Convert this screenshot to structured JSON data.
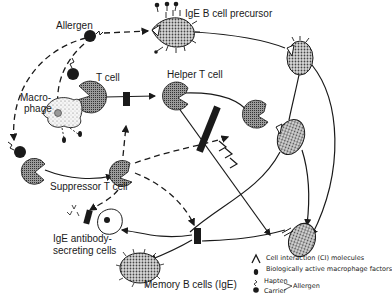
{
  "labels": {
    "allergen": "Allergen",
    "ige_b_precursor": "IgE B cell precursor",
    "t_cell": "T cell",
    "helper_t_cell": "Helper T cell",
    "macrophage_1": "Macro-",
    "macrophage_2": "phage",
    "suppressor_t_cell": "Suppressor T cell",
    "ige_secreting_1": "IgE antibody-",
    "ige_secreting_2": "secreting cells",
    "memory_b": "Memory B cells (IgE)"
  },
  "legend": {
    "ci": "Cell interaction (CI) molecules",
    "factors": "Biologically active macrophage factors",
    "hapten": "Hapten",
    "carrier": "Carrier",
    "allergen": "Allergen"
  },
  "colors": {
    "ink": "#1a1a1a",
    "tcell_fill": "#8a8a8a",
    "bcell_fill": "#bdbdbd"
  }
}
